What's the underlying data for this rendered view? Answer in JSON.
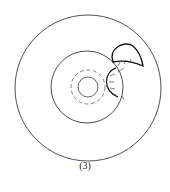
{
  "figure": {
    "caption": "(3)",
    "colors": {
      "stroke": "#222222",
      "background": "#ffffff"
    }
  }
}
